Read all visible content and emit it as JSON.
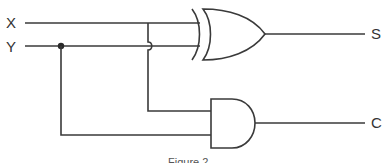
{
  "diagram": {
    "type": "half-adder logic circuit",
    "inputs": [
      {
        "label": "X"
      },
      {
        "label": "Y"
      }
    ],
    "outputs": [
      {
        "label": "S"
      },
      {
        "label": "C"
      }
    ],
    "gates": [
      {
        "type": "XOR",
        "inputs": [
          "X",
          "Y"
        ],
        "output": "S"
      },
      {
        "type": "AND",
        "inputs": [
          "X",
          "Y"
        ],
        "output": "C"
      }
    ],
    "caption": "Figure 2"
  },
  "colors": {
    "line": "#3a3a3a",
    "background": "#ffffff"
  }
}
